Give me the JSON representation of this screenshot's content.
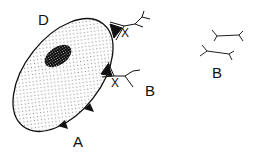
{
  "labels": {
    "cell": "D",
    "junction_upper": "X",
    "junction_lower": "X",
    "process": "B",
    "attachment": "A",
    "detached_process": "B"
  },
  "colors": {
    "outline": "#111111",
    "background": "#ffffff",
    "stipple": "#555555"
  }
}
